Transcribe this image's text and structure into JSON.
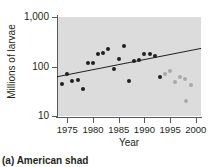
{
  "caption": "(a) American shad",
  "chart_data": {
    "type": "scatter",
    "title": "",
    "xlabel": "Year",
    "ylabel": "Millions of larvae",
    "xlim": [
      1973,
      2001
    ],
    "ylim": [
      10,
      1000
    ],
    "yscale": "log",
    "grid": false,
    "legend": "none",
    "xticks": [
      "1975",
      "1980",
      "1985",
      "1990",
      "1995",
      "2000"
    ],
    "xtick_values": [
      1975,
      1980,
      1985,
      1990,
      1995,
      2000
    ],
    "yticks": [
      "10",
      "100",
      "1,000"
    ],
    "ytick_values": [
      10,
      100,
      1000
    ],
    "series": [
      {
        "name": "larvae-abundance-early",
        "color": "#231f20",
        "points": [
          {
            "x": 1974,
            "y": 44
          },
          {
            "x": 1975,
            "y": 72
          },
          {
            "x": 1976,
            "y": 50
          },
          {
            "x": 1977,
            "y": 53
          },
          {
            "x": 1978,
            "y": 35
          },
          {
            "x": 1979,
            "y": 120
          },
          {
            "x": 1980,
            "y": 117
          },
          {
            "x": 1981,
            "y": 180
          },
          {
            "x": 1982,
            "y": 185
          },
          {
            "x": 1983,
            "y": 225
          },
          {
            "x": 1984,
            "y": 88
          },
          {
            "x": 1985,
            "y": 140
          },
          {
            "x": 1986,
            "y": 265
          },
          {
            "x": 1987,
            "y": 50
          },
          {
            "x": 1988,
            "y": 130
          },
          {
            "x": 1989,
            "y": 135
          },
          {
            "x": 1990,
            "y": 175
          },
          {
            "x": 1991,
            "y": 180
          },
          {
            "x": 1992,
            "y": 165
          },
          {
            "x": 1993,
            "y": 62
          }
        ]
      },
      {
        "name": "larvae-abundance-late",
        "color": "#a7a9ac",
        "points": [
          {
            "x": 1994,
            "y": 70
          },
          {
            "x": 1995,
            "y": 82
          },
          {
            "x": 1996,
            "y": 48
          },
          {
            "x": 1997,
            "y": 62
          },
          {
            "x": 1997.8,
            "y": 55
          },
          {
            "x": 1998,
            "y": 20
          },
          {
            "x": 1999,
            "y": 42
          }
        ]
      }
    ],
    "trendline": {
      "name": "linear-trend",
      "color": "#231f20",
      "x_start": 1973,
      "y_start": 62,
      "x_end": 2001,
      "y_end": 232
    }
  }
}
